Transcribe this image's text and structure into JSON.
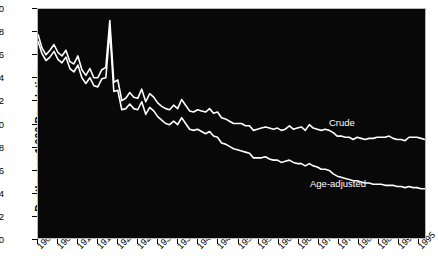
{
  "chart_data": {
    "type": "line",
    "title": "",
    "xlabel": "",
    "ylabel": "Deaths per 1,000 Population",
    "xlim": [
      1900,
      1997
    ],
    "ylim": [
      0,
      20
    ],
    "yticks": [
      0,
      2,
      4,
      6,
      8,
      10,
      12,
      14,
      16,
      18,
      20
    ],
    "xticks": [
      1900,
      1905,
      1910,
      1915,
      1920,
      1925,
      1930,
      1935,
      1940,
      1945,
      1950,
      1955,
      1960,
      1965,
      1970,
      1975,
      1980,
      1985,
      1990,
      1995
    ],
    "grid": false,
    "legend_position": "inline-annotation",
    "background": "#080808",
    "line_color": "#ffffff",
    "annotations": [
      {
        "text": "Crude",
        "x": 1967,
        "y": 10.9
      },
      {
        "text": "Age-adjusted",
        "x": 1962,
        "y": 5.8
      }
    ],
    "series": [
      {
        "name": "Crude",
        "x": [
          1900,
          1901,
          1902,
          1903,
          1904,
          1905,
          1906,
          1907,
          1908,
          1909,
          1910,
          1911,
          1912,
          1913,
          1914,
          1915,
          1916,
          1917,
          1918,
          1919,
          1920,
          1921,
          1922,
          1923,
          1924,
          1925,
          1926,
          1927,
          1928,
          1929,
          1930,
          1931,
          1932,
          1933,
          1934,
          1935,
          1936,
          1937,
          1938,
          1939,
          1940,
          1941,
          1942,
          1943,
          1944,
          1945,
          1946,
          1947,
          1948,
          1949,
          1950,
          1951,
          1952,
          1953,
          1954,
          1955,
          1956,
          1957,
          1958,
          1959,
          1960,
          1961,
          1962,
          1963,
          1964,
          1965,
          1966,
          1967,
          1968,
          1969,
          1970,
          1971,
          1972,
          1973,
          1974,
          1975,
          1976,
          1977,
          1978,
          1979,
          1980,
          1981,
          1982,
          1983,
          1984,
          1985,
          1986,
          1987,
          1988,
          1989,
          1990,
          1991,
          1992,
          1993,
          1994,
          1995,
          1996,
          1997
        ],
        "values": [
          17.8,
          16.6,
          16.0,
          16.4,
          16.9,
          16.2,
          15.9,
          16.4,
          15.4,
          15.2,
          15.9,
          14.7,
          14.2,
          14.8,
          14.0,
          14.0,
          14.7,
          14.9,
          19.0,
          13.6,
          13.8,
          12.0,
          12.2,
          12.7,
          12.3,
          12.2,
          13.0,
          11.9,
          12.6,
          12.3,
          11.8,
          11.5,
          11.3,
          11.2,
          11.6,
          11.3,
          12.1,
          11.6,
          11.1,
          11.0,
          11.2,
          11.1,
          11.0,
          11.3,
          10.9,
          11.0,
          10.5,
          10.4,
          10.2,
          10.0,
          10.0,
          10.0,
          9.8,
          9.8,
          9.4,
          9.5,
          9.6,
          9.7,
          9.6,
          9.5,
          9.6,
          9.4,
          9.5,
          9.8,
          9.5,
          9.6,
          9.7,
          9.4,
          9.9,
          9.6,
          9.5,
          9.4,
          9.5,
          9.4,
          9.2,
          8.9,
          8.9,
          8.8,
          8.8,
          8.6,
          8.8,
          8.7,
          8.6,
          8.7,
          8.7,
          8.8,
          8.8,
          8.8,
          8.9,
          8.7,
          8.6,
          8.6,
          8.5,
          8.8,
          8.8,
          8.8,
          8.7,
          8.6
        ]
      },
      {
        "name": "Age-adjusted",
        "x": [
          1900,
          1901,
          1902,
          1903,
          1904,
          1905,
          1906,
          1907,
          1908,
          1909,
          1910,
          1911,
          1912,
          1913,
          1914,
          1915,
          1916,
          1917,
          1918,
          1919,
          1920,
          1921,
          1922,
          1923,
          1924,
          1925,
          1926,
          1927,
          1928,
          1929,
          1930,
          1931,
          1932,
          1933,
          1934,
          1935,
          1936,
          1937,
          1938,
          1939,
          1940,
          1941,
          1942,
          1943,
          1944,
          1945,
          1946,
          1947,
          1948,
          1949,
          1950,
          1951,
          1952,
          1953,
          1954,
          1955,
          1956,
          1957,
          1958,
          1959,
          1960,
          1961,
          1962,
          1963,
          1964,
          1965,
          1966,
          1967,
          1968,
          1969,
          1970,
          1971,
          1972,
          1973,
          1974,
          1975,
          1976,
          1977,
          1978,
          1979,
          1980,
          1981,
          1982,
          1983,
          1984,
          1985,
          1986,
          1987,
          1988,
          1989,
          1990,
          1991,
          1992,
          1993,
          1994,
          1995,
          1996,
          1997
        ],
        "values": [
          17.2,
          16.1,
          15.5,
          15.8,
          16.3,
          15.6,
          15.3,
          15.8,
          14.8,
          14.5,
          15.1,
          14.0,
          13.5,
          14.0,
          13.3,
          13.2,
          13.9,
          14.0,
          18.1,
          12.8,
          12.9,
          11.2,
          11.3,
          11.7,
          11.3,
          11.2,
          11.9,
          10.8,
          11.4,
          11.1,
          10.6,
          10.3,
          10.0,
          9.9,
          10.2,
          9.9,
          10.5,
          10.0,
          9.5,
          9.4,
          9.5,
          9.3,
          9.1,
          9.3,
          8.9,
          8.8,
          8.3,
          8.2,
          8.0,
          7.8,
          7.7,
          7.6,
          7.5,
          7.4,
          7.0,
          7.0,
          7.0,
          7.1,
          6.9,
          6.8,
          6.8,
          6.6,
          6.7,
          6.8,
          6.6,
          6.5,
          6.5,
          6.3,
          6.5,
          6.3,
          6.2,
          6.0,
          6.0,
          5.9,
          5.6,
          5.4,
          5.3,
          5.2,
          5.1,
          5.0,
          5.0,
          4.9,
          4.8,
          4.8,
          4.7,
          4.7,
          4.7,
          4.6,
          4.6,
          4.6,
          4.5,
          4.5,
          4.4,
          4.5,
          4.4,
          4.4,
          4.3,
          4.3
        ]
      }
    ]
  },
  "axes": {
    "y_axis_label": "Deaths per 1,000 Population"
  }
}
